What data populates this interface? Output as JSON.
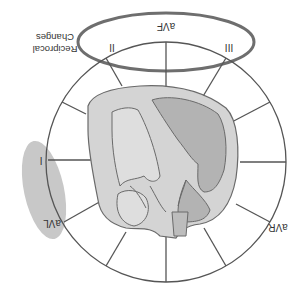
{
  "diagram": {
    "orientation": "upside-down",
    "leads": [
      {
        "id": "I",
        "label": "I"
      },
      {
        "id": "II",
        "label": "II"
      },
      {
        "id": "III",
        "label": "III"
      },
      {
        "id": "aVR",
        "label": "aVR"
      },
      {
        "id": "aVL",
        "label": "aVL"
      },
      {
        "id": "aVF",
        "label": "aVF"
      }
    ],
    "annotation": {
      "line1": "Reciprocal",
      "line2": "Changes"
    },
    "colors": {
      "circle_stroke": "#555555",
      "heart_outer": "#d4d4d4",
      "heart_dark_chamber": "#b3b3b3",
      "heart_light_chamber": "#dedede",
      "highlight_ellipse": "#c8c8c8",
      "reciprocal_ellipse_stroke": "#6e6e6e",
      "text": "#333333"
    }
  }
}
